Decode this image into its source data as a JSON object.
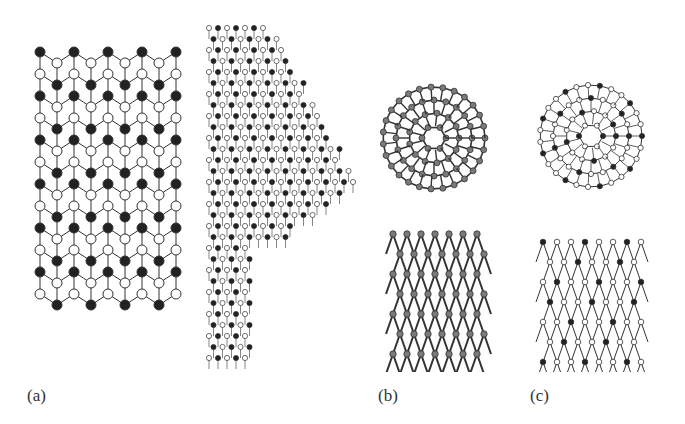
{
  "figure": {
    "panels": [
      {
        "id": "a",
        "label": "(a)",
        "description": "Nanotube models: capped cylindrical tube (left) and tube with conical cap (right), two-atom-type lattices (black and white atoms)"
      },
      {
        "id": "b",
        "label": "(b)",
        "description": "Cage (top view) and tubular structure (side view), dark shaded atoms"
      },
      {
        "id": "c",
        "label": "(c)",
        "description": "Cage (top view) and tubular structure (side view), mixed black/white atoms"
      }
    ]
  },
  "colors": {
    "dark_atom": "#222222",
    "light_atom": "#ffffff",
    "bond": "#333333",
    "grey_atom": "#7a7a7a"
  }
}
